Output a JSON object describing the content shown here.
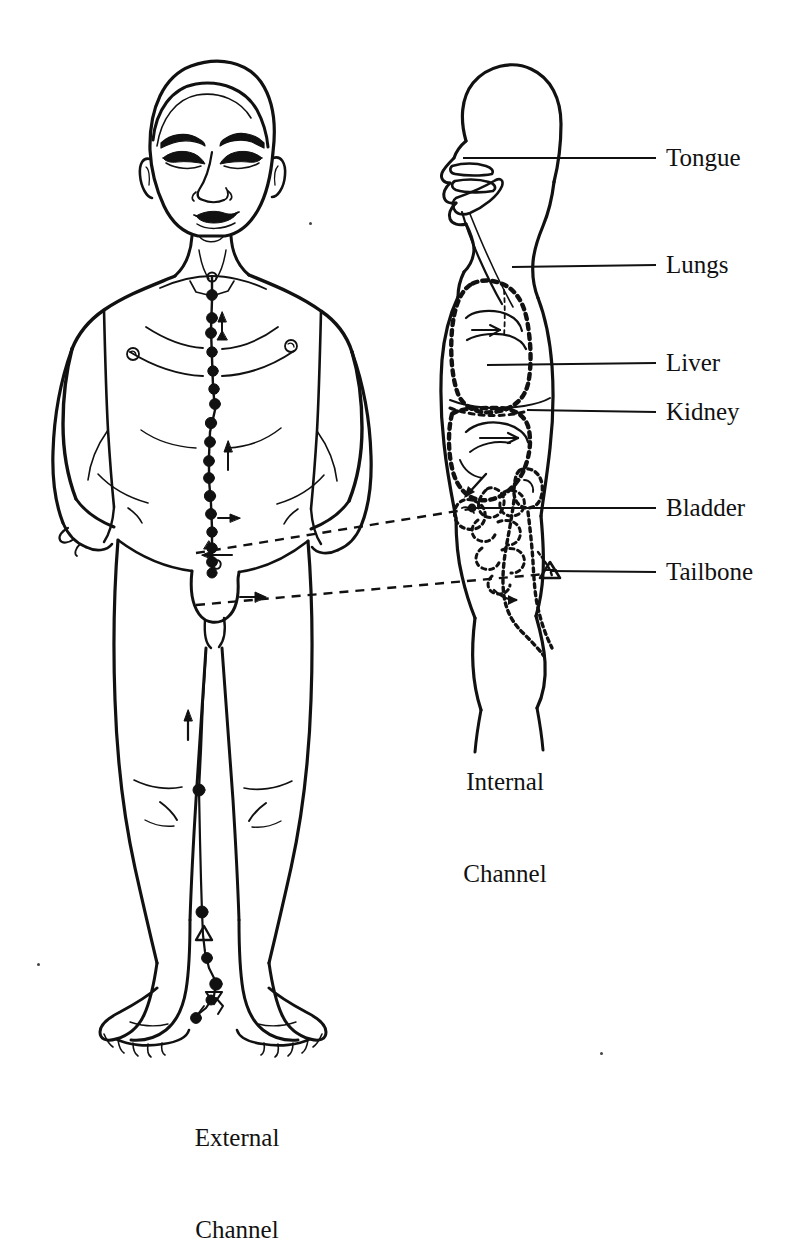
{
  "figure": {
    "title_hidden": "",
    "background_color": "#ffffff",
    "ink_color": "#111111"
  },
  "organ_labels": [
    {
      "id": "tongue",
      "text": "Tongue",
      "label_x": 666,
      "label_y": 158,
      "leader_from_x": 463,
      "leader_from_y": 158,
      "leader_to_x": 656,
      "leader_to_y": 158
    },
    {
      "id": "lungs",
      "text": "Lungs",
      "label_x": 666,
      "label_y": 265,
      "leader_from_x": 512,
      "leader_from_y": 267,
      "leader_to_x": 656,
      "leader_to_y": 265
    },
    {
      "id": "liver",
      "text": "Liver",
      "label_x": 666,
      "label_y": 363,
      "leader_from_x": 487,
      "leader_from_y": 365,
      "leader_to_x": 656,
      "leader_to_y": 363
    },
    {
      "id": "kidney",
      "text": "Kidney",
      "label_x": 666,
      "label_y": 412,
      "leader_from_x": 527,
      "leader_from_y": 410,
      "leader_to_x": 656,
      "leader_to_y": 412
    },
    {
      "id": "bladder",
      "text": "Bladder",
      "label_x": 666,
      "label_y": 508,
      "leader_from_x": 460,
      "leader_from_y": 508,
      "leader_to_x": 656,
      "leader_to_y": 508
    },
    {
      "id": "tailbone",
      "text": "Tailbone",
      "label_x": 666,
      "label_y": 572,
      "leader_from_x": 545,
      "leader_from_y": 570,
      "leader_to_x": 656,
      "leader_to_y": 572
    }
  ],
  "captions": {
    "internal": {
      "line1": "Internal",
      "line2": "Channel",
      "center_x": 505,
      "top_y": 706
    },
    "external": {
      "line1": "External",
      "line2": "Channel",
      "center_x": 237,
      "top_y": 1062
    }
  },
  "connectors": [
    {
      "id": "bladder-connector",
      "from_x": 196,
      "from_y": 553,
      "to_x": 487,
      "to_y": 508
    },
    {
      "id": "tailbone-connector",
      "from_x": 196,
      "from_y": 605,
      "to_x": 552,
      "to_y": 571
    }
  ],
  "meridian": {
    "name": "conception-vessel",
    "point_count": 22,
    "flow_direction": "upward",
    "arrow_count": 5
  }
}
